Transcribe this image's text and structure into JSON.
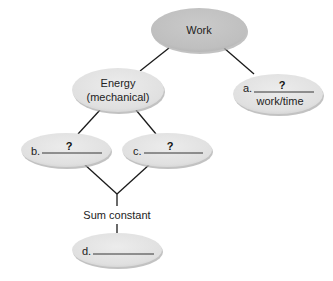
{
  "diagram": {
    "type": "concept-map",
    "colors": {
      "root_fill": "#c2c2c2",
      "node_fill": "#e2e2e2",
      "shadow": "#9a9a9a",
      "edge": "#1a1a1a",
      "text": "#222222"
    },
    "nodes": {
      "work": {
        "label": "Work"
      },
      "energy": {
        "line1": "Energy",
        "line2": "(mechanical)"
      },
      "a": {
        "prefix": "a.",
        "blank": "?",
        "sublabel": "work/time"
      },
      "b": {
        "prefix": "b.",
        "blank": "?"
      },
      "c": {
        "prefix": "c.",
        "blank": "?"
      },
      "d": {
        "prefix": "d.",
        "blank": ""
      }
    },
    "connector_label": "Sum constant",
    "edges": [
      {
        "from": "work",
        "to": "energy"
      },
      {
        "from": "work",
        "to": "a"
      },
      {
        "from": "energy",
        "to": "b"
      },
      {
        "from": "energy",
        "to": "c"
      },
      {
        "from": "b",
        "to": "sum-constant"
      },
      {
        "from": "c",
        "to": "sum-constant"
      },
      {
        "from": "sum-constant",
        "to": "d"
      }
    ]
  }
}
